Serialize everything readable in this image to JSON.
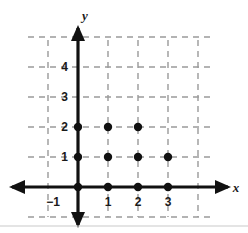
{
  "figure": {
    "width": 248,
    "height": 233,
    "background_color": "#ffffff",
    "baseline_rule_color": "#c9c9c9"
  },
  "chart_data": {
    "type": "scatter",
    "title": "",
    "xlabel": "x",
    "ylabel": "y",
    "grid": true,
    "grid_style": "dashed",
    "grid_color": "#9a9a9a",
    "axis_color": "#111111",
    "point_color": "#111111",
    "legend": "none",
    "xlim": [
      -1.65,
      4.45
    ],
    "ylim": [
      -1.6,
      5.35
    ],
    "x_tick_labels": [
      "−1",
      "1",
      "2",
      "3"
    ],
    "x_tick_values": [
      -1,
      1,
      2,
      3
    ],
    "y_tick_labels": [
      "1",
      "2",
      "3",
      "4"
    ],
    "y_tick_values": [
      1,
      2,
      3,
      4
    ],
    "x_gridlines": [
      -1,
      0,
      1,
      2,
      3,
      4
    ],
    "y_gridlines": [
      -1,
      0,
      1,
      2,
      3,
      4,
      5
    ],
    "points": [
      {
        "x": 0,
        "y": 0
      },
      {
        "x": 1,
        "y": 0
      },
      {
        "x": 2,
        "y": 0
      },
      {
        "x": 3,
        "y": 0
      },
      {
        "x": 0,
        "y": 1
      },
      {
        "x": 1,
        "y": 1
      },
      {
        "x": 2,
        "y": 1
      },
      {
        "x": 3,
        "y": 1
      },
      {
        "x": 0,
        "y": 2
      },
      {
        "x": 1,
        "y": 2
      },
      {
        "x": 2,
        "y": 2
      }
    ],
    "point_count": 11,
    "axis_arrows": [
      "left",
      "right",
      "up",
      "down"
    ]
  },
  "geometry": {
    "origin_x": 78,
    "origin_y": 187,
    "unit": 30,
    "grid_left": 28,
    "grid_right": 212,
    "grid_top": 40,
    "grid_bottom": 217,
    "point_radius": 4.2,
    "axis_stroke_width": 3.2,
    "grid_stroke_width": 1.4,
    "grid_dash": "6,5"
  },
  "labels": {
    "x_axis_name": "x",
    "y_axis_name": "y",
    "x_neg_one": "−1",
    "x_one": "1",
    "x_two": "2",
    "x_three": "3",
    "y_one": "1",
    "y_two": "2",
    "y_three": "3",
    "y_four": "4"
  }
}
